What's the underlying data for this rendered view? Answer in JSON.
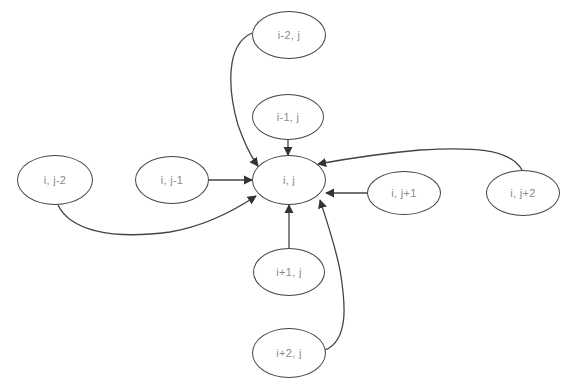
{
  "diagram": {
    "type": "stencil-dependency-graph",
    "center_node": "n_ij",
    "nodes": [
      {
        "id": "n_im2",
        "label": "i-2, j",
        "cx": 289,
        "cy": 35,
        "rx": 37,
        "ry": 24
      },
      {
        "id": "n_im1",
        "label": "i-1, j",
        "cx": 288,
        "cy": 117,
        "rx": 36,
        "ry": 23
      },
      {
        "id": "n_ij",
        "label": "i, j",
        "cx": 289,
        "cy": 180,
        "rx": 37,
        "ry": 25
      },
      {
        "id": "n_jm2",
        "label": "i, j-2",
        "cx": 55,
        "cy": 180,
        "rx": 38,
        "ry": 25
      },
      {
        "id": "n_jm1",
        "label": "i, j-1",
        "cx": 172,
        "cy": 180,
        "rx": 37,
        "ry": 24
      },
      {
        "id": "n_jp1",
        "label": "i, j+1",
        "cx": 404,
        "cy": 193,
        "rx": 37,
        "ry": 22
      },
      {
        "id": "n_jp2",
        "label": "i, j+2",
        "cx": 523,
        "cy": 193,
        "rx": 37,
        "ry": 23
      },
      {
        "id": "n_ip1",
        "label": "i+1, j",
        "cx": 289,
        "cy": 272,
        "rx": 36,
        "ry": 24
      },
      {
        "id": "n_ip2",
        "label": "i+2, j",
        "cx": 289,
        "cy": 353,
        "rx": 37,
        "ry": 25
      }
    ],
    "edges": [
      {
        "from": "n_im2",
        "to": "n_ij",
        "path": "M 252 33 C 225 45, 228 90, 238 125 C 245 145, 252 158, 258 166"
      },
      {
        "from": "n_im1",
        "to": "n_ij",
        "path": "M 288 140 L 288 155"
      },
      {
        "from": "n_jm1",
        "to": "n_ij",
        "path": "M 209 180 L 252 180"
      },
      {
        "from": "n_jm2",
        "to": "n_ij",
        "path": "M 58 205 C 70 230, 110 240, 170 232 C 205 226, 235 210, 256 196"
      },
      {
        "from": "n_jp1",
        "to": "n_ij",
        "path": "M 367 193 L 326 193"
      },
      {
        "from": "n_jp2",
        "to": "n_ij",
        "path": "M 522 170 C 510 148, 470 147, 420 150 C 375 154, 340 160, 318 164"
      },
      {
        "from": "n_ip1",
        "to": "n_ij",
        "path": "M 289 248 L 289 205"
      },
      {
        "from": "n_ip2",
        "to": "n_ij",
        "path": "M 325 350 C 350 340, 345 300, 340 270 C 335 245, 328 225, 320 200"
      }
    ],
    "colors": {
      "stroke": "#444444",
      "label": "#8a8a8a",
      "background": "#ffffff"
    }
  }
}
